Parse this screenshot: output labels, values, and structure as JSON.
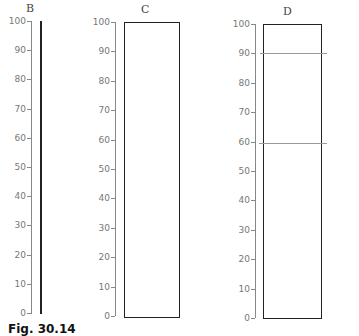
{
  "panels": [
    {
      "label": "B",
      "type": "line",
      "from": 0,
      "to": 100
    },
    {
      "label": "C",
      "type": "box",
      "from": 0,
      "to": 100
    },
    {
      "label": "D",
      "type": "box",
      "from": 0,
      "to": 100,
      "reference_lines": [
        90,
        60
      ]
    }
  ],
  "axis_ticks": [
    "100",
    "90",
    "80",
    "70",
    "60",
    "50",
    "40",
    "30",
    "20",
    "10",
    "0"
  ],
  "caption": {
    "prefix": "Fig. 30.14",
    "rest": "(caption cut off)"
  },
  "chart_data": {
    "type": "bar",
    "title": "",
    "categories": [
      "B",
      "C",
      "D"
    ],
    "values": [
      100,
      100,
      100
    ],
    "ylim": [
      0,
      100
    ],
    "yticks": [
      0,
      10,
      20,
      30,
      40,
      50,
      60,
      70,
      80,
      90,
      100
    ],
    "annotations": [
      {
        "panel": "B",
        "note": "drawn as a thin vertical line from 0 to 100"
      },
      {
        "panel": "C",
        "note": "drawn as an open rectangle from 0 to 100"
      },
      {
        "panel": "D",
        "note": "open rectangle from 0 to 100 with horizontal lines at 90 and 60"
      }
    ]
  }
}
